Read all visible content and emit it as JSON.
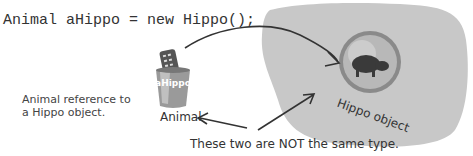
{
  "code_line": "Animal aHippo = new Hippo();",
  "reference": {
    "variable_name": "aHippo",
    "type_label": "Animal",
    "note": [
      "Animal reference to",
      "a Hippo object."
    ]
  },
  "object": {
    "label": "Hippo object"
  },
  "caption": "These two are NOT the same type.",
  "colors": {
    "heap": "#c8c8c8",
    "ink": "#333333",
    "cup": "#9a9a9a",
    "bubble": "#a0a0a0"
  }
}
